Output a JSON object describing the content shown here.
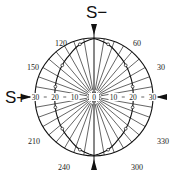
{
  "diagram": {
    "type": "polar-diagram",
    "center": [
      94,
      97
    ],
    "outer_radius": 59,
    "units_per_ring": 10,
    "px_per_unit": 1.95,
    "labels": {
      "top_pole": "S−",
      "left_pole": "S+",
      "angles": [
        {
          "text": "120",
          "x": 55,
          "y": 40
        },
        {
          "text": "60",
          "x": 133,
          "y": 40
        },
        {
          "text": "150",
          "x": 27,
          "y": 64
        },
        {
          "text": "30",
          "x": 157,
          "y": 64
        },
        {
          "text": "210",
          "x": 28,
          "y": 138
        },
        {
          "text": "330",
          "x": 157,
          "y": 138
        },
        {
          "text": "240",
          "x": 58,
          "y": 164
        },
        {
          "text": "300",
          "x": 131,
          "y": 164
        }
      ],
      "radial_left": [
        "30",
        "20",
        "10"
      ],
      "radial_right": [
        "10",
        "20",
        "30"
      ],
      "center": "0"
    },
    "curve_r_units": {
      "0": 20,
      "15": 20.5,
      "30": 21.5,
      "45": 23,
      "60": 25,
      "75": 28,
      "90": 30,
      "105": 28,
      "120": 25,
      "135": 23,
      "150": 21.5,
      "165": 20.5,
      "180": 20,
      "195": 20.5,
      "210": 21.5,
      "225": 23,
      "240": 25,
      "255": 28,
      "270": 30,
      "285": 28,
      "300": 25,
      "315": 23,
      "330": 21.5,
      "345": 20.5
    }
  }
}
